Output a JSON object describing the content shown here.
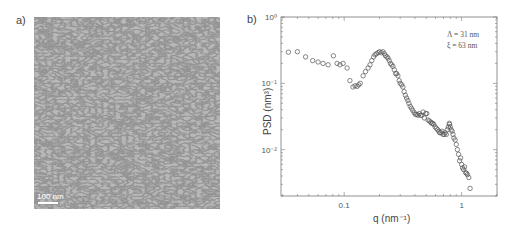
{
  "panel_a": {
    "label": "a)",
    "scale_bar": "100 nm"
  },
  "panel_b": {
    "label": "b)",
    "annotation_lines": [
      "Λ = 31 nm",
      "ξ = 63 nm"
    ],
    "xlabel": "q (nm⁻¹)",
    "ylabel": "PSD (nm³)",
    "x_ticks": [
      {
        "value": 0.1,
        "label": "0.1"
      },
      {
        "value": 1,
        "label": "1"
      }
    ],
    "y_ticks": [
      {
        "value": 1,
        "label": "10⁰"
      },
      {
        "value": 0.1,
        "label": "10⁻¹"
      },
      {
        "value": 0.01,
        "label": "10⁻²"
      }
    ]
  },
  "chart_data": {
    "type": "scatter",
    "title": "",
    "xlabel": "q (nm^-1)",
    "ylabel": "PSD (nm^3)",
    "xscale": "log",
    "yscale": "log",
    "xlim": [
      0.029,
      2.0
    ],
    "ylim": [
      0.002,
      1
    ],
    "grid": false,
    "legend": null,
    "annotations": [
      "Λ = 31 nm",
      "ξ = 63 nm"
    ],
    "marker": "open-circle",
    "series": [
      {
        "name": "PSD",
        "x": [
          0.0335,
          0.04,
          0.047,
          0.054,
          0.06,
          0.066,
          0.073,
          0.081,
          0.087,
          0.092,
          0.098,
          0.106,
          0.112,
          0.119,
          0.124,
          0.129,
          0.133,
          0.137,
          0.145,
          0.152,
          0.16,
          0.166,
          0.172,
          0.178,
          0.183,
          0.189,
          0.194,
          0.2,
          0.207,
          0.214,
          0.22,
          0.225,
          0.231,
          0.236,
          0.242,
          0.248,
          0.254,
          0.26,
          0.267,
          0.274,
          0.28,
          0.287,
          0.294,
          0.3,
          0.308,
          0.316,
          0.324,
          0.332,
          0.34,
          0.348,
          0.356,
          0.365,
          0.374,
          0.384,
          0.395,
          0.405,
          0.415,
          0.425,
          0.436,
          0.447,
          0.458,
          0.47,
          0.482,
          0.494,
          0.505,
          0.518,
          0.531,
          0.545,
          0.556,
          0.567,
          0.58,
          0.595,
          0.61,
          0.625,
          0.638,
          0.65,
          0.665,
          0.68,
          0.695,
          0.71,
          0.725,
          0.74,
          0.755,
          0.77,
          0.785,
          0.79,
          0.8,
          0.815,
          0.83,
          0.845,
          0.86,
          0.88,
          0.9,
          0.92,
          0.94,
          0.96,
          0.98,
          1.0,
          1.02,
          1.04,
          1.06,
          1.08,
          1.1,
          1.12,
          1.15,
          1.18
        ],
        "y": [
          0.295,
          0.3,
          0.25,
          0.22,
          0.21,
          0.2,
          0.19,
          0.26,
          0.2,
          0.19,
          0.2,
          0.17,
          0.11,
          0.088,
          0.092,
          0.09,
          0.095,
          0.1,
          0.13,
          0.15,
          0.17,
          0.19,
          0.22,
          0.25,
          0.27,
          0.28,
          0.29,
          0.3,
          0.29,
          0.3,
          0.28,
          0.26,
          0.25,
          0.24,
          0.22,
          0.2,
          0.19,
          0.18,
          0.16,
          0.14,
          0.14,
          0.13,
          0.11,
          0.1,
          0.095,
          0.088,
          0.075,
          0.066,
          0.06,
          0.055,
          0.05,
          0.045,
          0.042,
          0.039,
          0.036,
          0.034,
          0.034,
          0.033,
          0.035,
          0.033,
          0.033,
          0.037,
          0.03,
          0.035,
          0.035,
          0.028,
          0.027,
          0.026,
          0.025,
          0.025,
          0.024,
          0.022,
          0.021,
          0.02,
          0.019,
          0.018,
          0.018,
          0.019,
          0.017,
          0.017,
          0.018,
          0.017,
          0.02,
          0.022,
          0.025,
          0.024,
          0.022,
          0.02,
          0.019,
          0.017,
          0.015,
          0.014,
          0.012,
          0.01,
          0.0085,
          0.0068,
          0.0075,
          0.006,
          0.0053,
          0.005,
          0.0055,
          0.0045,
          0.0044,
          0.0042,
          0.0038,
          0.0026
        ]
      }
    ]
  }
}
